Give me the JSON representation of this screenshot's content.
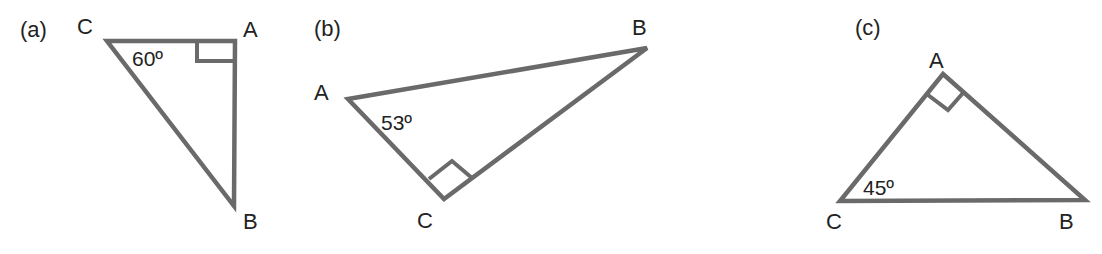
{
  "figures": [
    {
      "id": "a",
      "tag": "(a)",
      "vertices": {
        "A": "A",
        "B": "B",
        "C": "C"
      },
      "angle_label": "60º",
      "angle_at": "C",
      "right_angle_at": "A"
    },
    {
      "id": "b",
      "tag": "(b)",
      "vertices": {
        "A": "A",
        "B": "B",
        "C": "C"
      },
      "angle_label": "53º",
      "angle_at": "A",
      "right_angle_at": "C"
    },
    {
      "id": "c",
      "tag": "(c)",
      "vertices": {
        "A": "A",
        "B": "B",
        "C": "C"
      },
      "angle_label": "45º",
      "angle_at": "C",
      "right_angle_at": "A"
    }
  ],
  "colors": {
    "stroke": "#6a6a6a",
    "text": "#222222",
    "background": "#ffffff"
  }
}
